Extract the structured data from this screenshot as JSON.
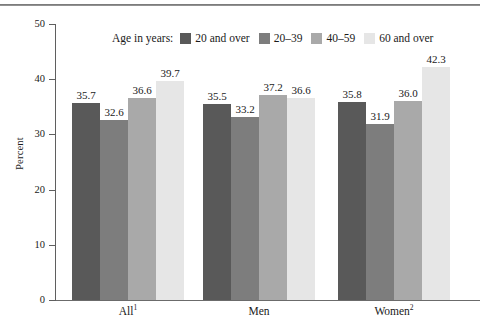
{
  "figure": {
    "top_rule": "horizontal-rule"
  },
  "legend": {
    "title": "Age in years:",
    "entries": [
      {
        "label": "20 and over",
        "color": "#595959"
      },
      {
        "label": "20–39",
        "color": "#7d7d7d"
      },
      {
        "label": "40–59",
        "color": "#a9a9a9"
      },
      {
        "label": "60 and over",
        "color": "#e6e6e6"
      }
    ]
  },
  "chart_data": {
    "type": "bar",
    "title": "",
    "xlabel": "",
    "ylabel": "Percent",
    "ylim": [
      0,
      50
    ],
    "yticks": [
      0,
      10,
      20,
      30,
      40,
      50
    ],
    "ytick_labels": [
      "0",
      "10",
      "20",
      "30",
      "40",
      "50"
    ],
    "grid": false,
    "legend_position": "top-center",
    "categories": [
      "All",
      "Men",
      "Women"
    ],
    "category_labels_super": [
      "1",
      "",
      "2"
    ],
    "series": [
      {
        "name": "20 and over",
        "color": "#595959",
        "values": [
          35.7,
          35.5,
          35.8
        ]
      },
      {
        "name": "20–39",
        "color": "#7d7d7d",
        "values": [
          32.6,
          33.2,
          31.9
        ]
      },
      {
        "name": "40–59",
        "color": "#a9a9a9",
        "values": [
          36.6,
          37.2,
          36.0
        ]
      },
      {
        "name": "60 and over",
        "color": "#e6e6e6",
        "values": [
          39.7,
          36.6,
          42.3
        ]
      }
    ],
    "data_labels": [
      [
        "35.7",
        "32.6",
        "36.6",
        "39.7"
      ],
      [
        "35.5",
        "33.2",
        "37.2",
        "36.6"
      ],
      [
        "35.8",
        "31.9",
        "36.0",
        "42.3"
      ]
    ]
  }
}
